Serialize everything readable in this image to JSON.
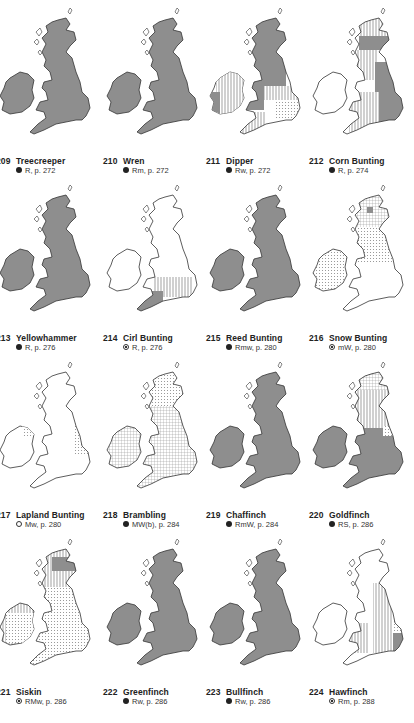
{
  "page": {
    "type": "distribution-map-plates",
    "layout": "4 columns x 4 rows"
  },
  "colors": {
    "occupied": "#8e8e8e",
    "outline": "#333333",
    "hatch": "#666666",
    "paper": "#ffffff"
  },
  "legend_symbols": {
    "filled": "filled-circle",
    "open": "open-circle",
    "dotted": "dotted-circle"
  },
  "maps": [
    {
      "number": "209",
      "name": "Treecreeper",
      "symbol": "filled",
      "status": "R, p. 272",
      "pattern": "full"
    },
    {
      "number": "210",
      "name": "Wren",
      "symbol": "filled",
      "status": "Rm, p. 272",
      "pattern": "full"
    },
    {
      "number": "211",
      "name": "Dipper",
      "symbol": "filled",
      "status": "Rw, p. 272",
      "pattern": "dipper"
    },
    {
      "number": "212",
      "name": "Corn Bunting",
      "symbol": "filled",
      "status": "R, p. 274",
      "pattern": "cornbunting"
    },
    {
      "number": "213",
      "name": "Yellowhammer",
      "symbol": "filled",
      "status": "R, p. 276",
      "pattern": "full"
    },
    {
      "number": "214",
      "name": "Cirl Bunting",
      "symbol": "dotted",
      "status": "R, p. 276",
      "pattern": "cirl"
    },
    {
      "number": "215",
      "name": "Reed Bunting",
      "symbol": "filled",
      "status": "Rmw, p. 280",
      "pattern": "full"
    },
    {
      "number": "216",
      "name": "Snow Bunting",
      "symbol": "dotted",
      "status": "mW, p. 280",
      "pattern": "snow"
    },
    {
      "number": "217",
      "name": "Lapland Bunting",
      "symbol": "open",
      "status": "Mw, p. 280",
      "pattern": "lapland"
    },
    {
      "number": "218",
      "name": "Brambling",
      "symbol": "filled",
      "status": "MW(b), p. 284",
      "pattern": "brambling"
    },
    {
      "number": "219",
      "name": "Chaffinch",
      "symbol": "filled",
      "status": "RmW, p. 284",
      "pattern": "full"
    },
    {
      "number": "220",
      "name": "Goldfinch",
      "symbol": "filled",
      "status": "RS, p. 286",
      "pattern": "goldfinch"
    },
    {
      "number": "221",
      "name": "Siskin",
      "symbol": "dotted",
      "status": "RMw, p. 286",
      "pattern": "siskin"
    },
    {
      "number": "222",
      "name": "Greenfinch",
      "symbol": "filled",
      "status": "Rw, p. 286",
      "pattern": "full"
    },
    {
      "number": "223",
      "name": "Bullfinch",
      "symbol": "filled",
      "status": "Rw, p. 286",
      "pattern": "full"
    },
    {
      "number": "224",
      "name": "Hawfinch",
      "symbol": "dotted",
      "status": "Rm, p. 288",
      "pattern": "hawfinch"
    }
  ]
}
